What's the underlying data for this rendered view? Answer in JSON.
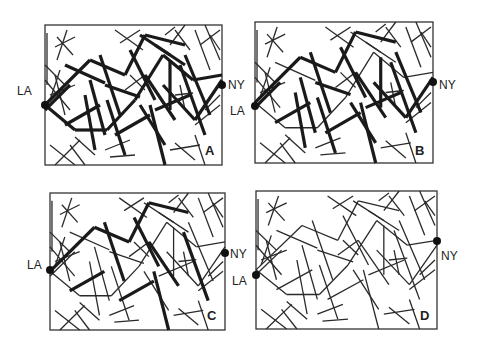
{
  "figure": {
    "panels": [
      {
        "letter": "A",
        "left_label": "LA",
        "right_label": "NY",
        "box": [
          45,
          25,
          177,
          140
        ],
        "la_y": 80,
        "ny_y": 60,
        "thick_level": 3
      },
      {
        "letter": "B",
        "left_label": "LA",
        "right_label": "NY",
        "box": [
          255,
          22,
          178,
          141
        ],
        "la_y": 84,
        "ny_y": 60,
        "thick_level": 2
      },
      {
        "letter": "C",
        "left_label": "LA",
        "right_label": "NY",
        "box": [
          50,
          193,
          175,
          137
        ],
        "la_y": 77,
        "ny_y": 60,
        "thick_level": 1
      },
      {
        "letter": "D",
        "left_label": "LA",
        "right_label": "NY",
        "box": [
          256,
          191,
          181,
          138
        ],
        "la_y": 84,
        "ny_y": 50,
        "thick_level": 0
      }
    ],
    "colors": {
      "line": "#1a1a1a",
      "frame": "#333333",
      "background": "#ffffff"
    }
  }
}
